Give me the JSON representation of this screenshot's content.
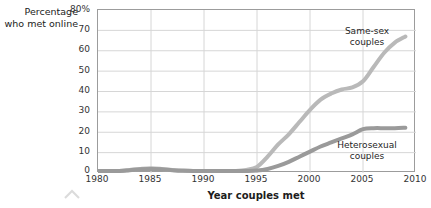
{
  "chart_data": {
    "type": "line",
    "title": "",
    "xlabel": "Year couples met",
    "ylabel": "Percentage who met online",
    "xlim": [
      1980,
      2010
    ],
    "ylim": [
      0,
      80
    ],
    "grid": true,
    "legend_position": "inline-annotations",
    "xticks": [
      "1980",
      "1985",
      "1990",
      "1995",
      "2000",
      "2005",
      "2010"
    ],
    "yticks": [
      "80%",
      "70",
      "60",
      "50",
      "40",
      "30",
      "20",
      "10",
      "0"
    ],
    "ytick_values": [
      80,
      70,
      60,
      50,
      40,
      30,
      20,
      10,
      0
    ],
    "xtick_values": [
      1980,
      1985,
      1990,
      1995,
      2000,
      2005,
      2010
    ],
    "x": [
      1980,
      1981,
      1982,
      1983,
      1984,
      1985,
      1986,
      1987,
      1988,
      1989,
      1990,
      1991,
      1992,
      1993,
      1994,
      1995,
      1996,
      1997,
      1998,
      1999,
      2000,
      2001,
      2002,
      2003,
      2004,
      2005,
      2006,
      2007,
      2008,
      2009
    ],
    "series": [
      {
        "name": "Same-sex couples",
        "color": "#b9b9b9",
        "values": [
          1,
          1,
          1,
          1.5,
          2,
          2.3,
          2,
          1.5,
          1.2,
          1,
          1,
          1,
          1,
          1,
          1.5,
          3,
          8,
          14,
          19,
          25,
          31,
          36,
          39,
          41,
          42,
          45,
          52,
          59,
          64,
          67
        ]
      },
      {
        "name": "Heterosexual couples",
        "color": "#9a9a9a",
        "values": [
          1,
          1,
          1,
          1.3,
          1.8,
          2,
          1.8,
          1.4,
          1.1,
          1,
          1,
          1,
          1,
          1,
          1,
          1.2,
          2,
          3.5,
          5.5,
          8,
          10.5,
          13,
          15,
          17,
          19,
          21.5,
          22,
          22,
          22,
          22.2
        ]
      }
    ],
    "annotations": [
      {
        "text": "Same-sex couples",
        "series": "Same-sex couples"
      },
      {
        "text": "Heterosexual couples",
        "series": "Heterosexual couples"
      }
    ]
  },
  "labels": {
    "y_axis_title": "Percentage who met online",
    "x_axis_title": "Year couples met",
    "same_sex": "Same-sex couples",
    "hetero": "Heterosexual couples"
  },
  "colors": {
    "same_sex": "#b9b9b9",
    "hetero": "#9a9a9a",
    "grid": "#d6d6d6",
    "frame": "#9c9c9c",
    "text": "#2b2b2b"
  }
}
